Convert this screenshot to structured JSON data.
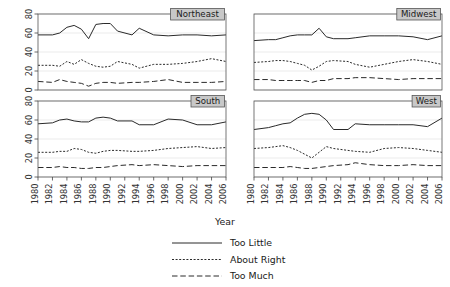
{
  "figure": {
    "title": "",
    "xlabel": "Year",
    "ylabel": ""
  },
  "legend": {
    "items": [
      {
        "label": "Too Little",
        "style": "solid"
      },
      {
        "label": "About Right",
        "style": "dotted"
      },
      {
        "label": "Too Much",
        "style": "dashed"
      }
    ]
  },
  "axes": {
    "y_ticks": [
      "0",
      "20",
      "40",
      "60",
      "80"
    ],
    "x_ticks": [
      "1980",
      "1982",
      "1984",
      "1986",
      "1988",
      "1990",
      "1992",
      "1994",
      "1996",
      "1998",
      "2000",
      "2002",
      "2004",
      "2006"
    ]
  },
  "panels": [
    {
      "name": "Northeast"
    },
    {
      "name": "Midwest"
    },
    {
      "name": "South"
    },
    {
      "name": "West"
    }
  ],
  "chart_data": {
    "type": "line",
    "title": "",
    "xlabel": "Year",
    "ylabel": "",
    "xlim": [
      1980,
      2006
    ],
    "ylim": [
      0,
      80
    ],
    "grid": true,
    "legend_position": "bottom",
    "panel_layout": "2x2",
    "x": [
      1980,
      1982,
      1983,
      1984,
      1985,
      1986,
      1987,
      1988,
      1989,
      1990,
      1991,
      1993,
      1994,
      1996,
      1998,
      2000,
      2002,
      2004,
      2006
    ],
    "panels": [
      {
        "name": "Northeast",
        "series": [
          {
            "name": "Too Little",
            "style": "solid",
            "values": [
              58,
              58,
              60,
              66,
              68,
              64,
              54,
              69,
              70,
              70,
              62,
              58,
              65,
              58,
              57,
              58,
              58,
              57,
              58
            ]
          },
          {
            "name": "About Right",
            "style": "dotted",
            "values": [
              26,
              26,
              25,
              30,
              27,
              32,
              28,
              25,
              24,
              25,
              30,
              27,
              23,
              27,
              27,
              28,
              30,
              33,
              30
            ]
          },
          {
            "name": "Too Much",
            "style": "dashed",
            "values": [
              9,
              8,
              11,
              9,
              8,
              7,
              4,
              7,
              8,
              8,
              7,
              8,
              8,
              9,
              11,
              8,
              8,
              8,
              9
            ]
          }
        ]
      },
      {
        "name": "Midwest",
        "series": [
          {
            "name": "Too Little",
            "style": "solid",
            "values": [
              52,
              53,
              53,
              55,
              57,
              58,
              58,
              58,
              65,
              56,
              54,
              54,
              55,
              57,
              57,
              57,
              56,
              53,
              57
            ]
          },
          {
            "name": "About Right",
            "style": "dotted",
            "values": [
              29,
              30,
              31,
              31,
              30,
              28,
              26,
              21,
              25,
              30,
              31,
              30,
              27,
              24,
              27,
              30,
              32,
              30,
              27
            ]
          },
          {
            "name": "Too Much",
            "style": "dashed",
            "values": [
              11,
              11,
              10,
              10,
              10,
              10,
              10,
              8,
              10,
              10,
              12,
              12,
              13,
              13,
              12,
              11,
              12,
              12,
              12
            ]
          }
        ]
      },
      {
        "name": "South",
        "series": [
          {
            "name": "Too Little",
            "style": "solid",
            "values": [
              56,
              57,
              60,
              61,
              59,
              58,
              58,
              62,
              63,
              62,
              59,
              59,
              55,
              55,
              61,
              60,
              55,
              55,
              58
            ]
          },
          {
            "name": "About Right",
            "style": "dotted",
            "values": [
              26,
              26,
              27,
              27,
              30,
              29,
              26,
              25,
              27,
              28,
              28,
              27,
              27,
              28,
              30,
              31,
              32,
              30,
              31
            ]
          },
          {
            "name": "Too Much",
            "style": "dashed",
            "values": [
              10,
              10,
              11,
              10,
              10,
              9,
              9,
              10,
              10,
              11,
              12,
              13,
              12,
              13,
              12,
              11,
              12,
              12,
              12
            ]
          }
        ]
      },
      {
        "name": "West",
        "series": [
          {
            "name": "Too Little",
            "style": "solid",
            "values": [
              50,
              52,
              54,
              56,
              57,
              62,
              66,
              67,
              66,
              60,
              50,
              50,
              56,
              55,
              55,
              55,
              55,
              53,
              62
            ]
          },
          {
            "name": "About Right",
            "style": "dotted",
            "values": [
              30,
              31,
              32,
              33,
              31,
              28,
              24,
              20,
              26,
              32,
              30,
              28,
              27,
              26,
              30,
              31,
              30,
              28,
              26
            ]
          },
          {
            "name": "Too Much",
            "style": "dashed",
            "values": [
              10,
              10,
              10,
              10,
              11,
              10,
              9,
              9,
              10,
              11,
              12,
              13,
              15,
              13,
              12,
              12,
              13,
              12,
              12
            ]
          }
        ]
      }
    ]
  }
}
